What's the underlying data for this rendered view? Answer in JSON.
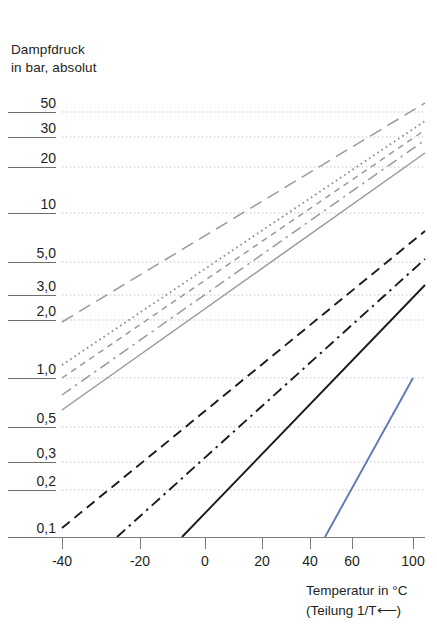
{
  "chart_data": {
    "type": "line",
    "title": "Dampfdruck in bar, absolut",
    "title_line1": "Dampfdruck",
    "title_line2": "in bar, absolut",
    "ylabel": "Dampfdruck in bar, absolut",
    "xlabel": "Temperatur in °C",
    "xlabel_note": "(Teilung 1/T⟵)",
    "x_scale": "reciprocal-temperature (1/T)",
    "y_scale": "logarithmic",
    "grid": "horizontal dotted gridlines at each labeled pressure",
    "legend": "none",
    "ylim": [
      0.1,
      50
    ],
    "xlim": [
      -40,
      100
    ],
    "y_ticks": [
      {
        "label": "50",
        "value": 50,
        "y": 112
      },
      {
        "label": "30",
        "value": 30,
        "y": 137
      },
      {
        "label": "20",
        "value": 20,
        "y": 167
      },
      {
        "label": "10",
        "value": 10,
        "y": 213
      },
      {
        "label": "5,0",
        "value": 5,
        "y": 262
      },
      {
        "label": "3,0",
        "value": 3,
        "y": 295
      },
      {
        "label": "2,0",
        "value": 2,
        "y": 320
      },
      {
        "label": "1,0",
        "value": 1,
        "y": 378
      },
      {
        "label": "0,5",
        "value": 0.5,
        "y": 427
      },
      {
        "label": "0,3",
        "value": 0.3,
        "y": 462
      },
      {
        "label": "0,2",
        "value": 0.2,
        "y": 490
      },
      {
        "label": "0,1",
        "value": 0.1,
        "y": 537
      }
    ],
    "x_ticks": [
      {
        "label": "-40",
        "value": -40,
        "x": 62
      },
      {
        "label": "-20",
        "value": -20,
        "x": 140
      },
      {
        "label": "0",
        "value": 0,
        "x": 205
      },
      {
        "label": "20",
        "value": 20,
        "x": 262
      },
      {
        "label": "40",
        "value": 40,
        "x": 310
      },
      {
        "label": "60",
        "value": 60,
        "x": 352
      },
      {
        "label": "100",
        "value": 100,
        "x": 413
      }
    ],
    "series": [
      {
        "name": "line-1",
        "color": "#9a9a9a",
        "style": "long-dash",
        "points": [
          [
            62,
            322
          ],
          [
            425,
            103
          ]
        ]
      },
      {
        "name": "line-2",
        "color": "#8f8f8f",
        "style": "dotted",
        "points": [
          [
            62,
            365
          ],
          [
            425,
            121
          ]
        ]
      },
      {
        "name": "line-3",
        "color": "#9a9a9a",
        "style": "short-dash",
        "points": [
          [
            62,
            378
          ],
          [
            425,
            130
          ]
        ]
      },
      {
        "name": "line-4",
        "color": "#9a9a9a",
        "style": "dash-dot",
        "points": [
          [
            62,
            395
          ],
          [
            425,
            140
          ]
        ]
      },
      {
        "name": "line-5",
        "color": "#9a9a9a",
        "style": "solid",
        "points": [
          [
            62,
            410
          ],
          [
            425,
            153
          ]
        ]
      },
      {
        "name": "line-6",
        "color": "#1a1a1a",
        "style": "dashed",
        "points": [
          [
            62,
            528
          ],
          [
            425,
            231
          ]
        ]
      },
      {
        "name": "line-7",
        "color": "#1a1a1a",
        "style": "dash-dot",
        "points": [
          [
            117,
            537
          ],
          [
            425,
            259
          ]
        ]
      },
      {
        "name": "line-8",
        "color": "#1a1a1a",
        "style": "solid",
        "points": [
          [
            182,
            537
          ],
          [
            425,
            285
          ]
        ]
      },
      {
        "name": "line-9",
        "color": "#5b7ab5",
        "style": "solid",
        "points": [
          [
            325,
            537
          ],
          [
            413,
            378
          ]
        ]
      }
    ]
  },
  "colors": {
    "gray_line": "#9a9a9a",
    "black_line": "#1a1a1a",
    "blue_line": "#5b7ab5",
    "grid": "#b9b9b9",
    "axis": "#7a7a7a",
    "text": "#231f20"
  }
}
